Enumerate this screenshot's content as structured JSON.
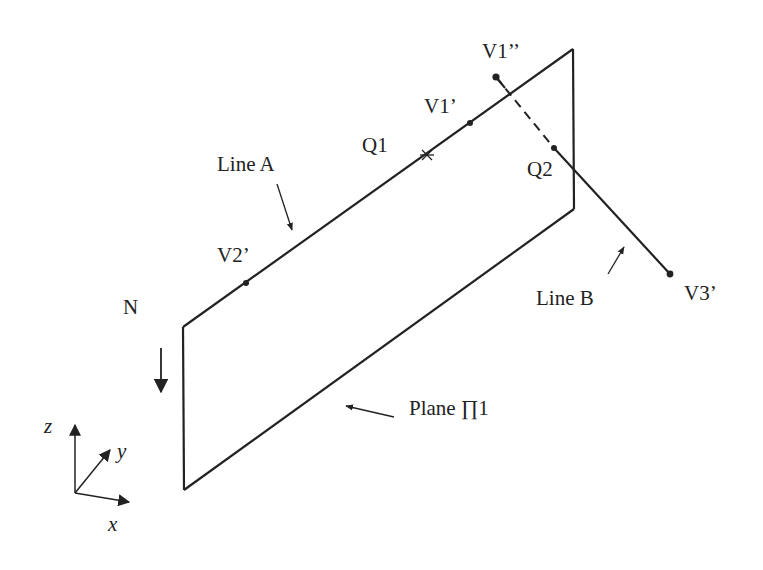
{
  "figure": {
    "plane": {
      "label": "Plane ∏1",
      "corners": [
        [
          183,
          327
        ],
        [
          573,
          49
        ],
        [
          574,
          209
        ],
        [
          184,
          490
        ]
      ]
    },
    "line_a": {
      "label": "Line A",
      "points": {
        "Q1": {
          "label": "Q1",
          "marker": "star",
          "pos": [
            427,
            155
          ]
        },
        "V1_prime": {
          "label": "V1’",
          "marker": "dot",
          "pos": [
            470,
            123
          ]
        },
        "V2_prime": {
          "label": "V2’",
          "marker": "dot",
          "pos": [
            246,
            283
          ]
        }
      }
    },
    "line_b": {
      "label": "Line B",
      "points": {
        "V1_double_prime": {
          "label": "V1’’",
          "marker": "dot",
          "pos": [
            496,
            77
          ]
        },
        "Q2": {
          "label": "Q2",
          "marker": "dot",
          "pos": [
            554,
            148
          ]
        },
        "V3_prime": {
          "label": "V3’",
          "marker": "dot",
          "pos": [
            670,
            274
          ]
        }
      },
      "hidden_segment": "dashed"
    },
    "normal": {
      "label": "N",
      "direction": "down"
    },
    "axes": {
      "x": "x",
      "y": "y",
      "z": "z"
    }
  }
}
